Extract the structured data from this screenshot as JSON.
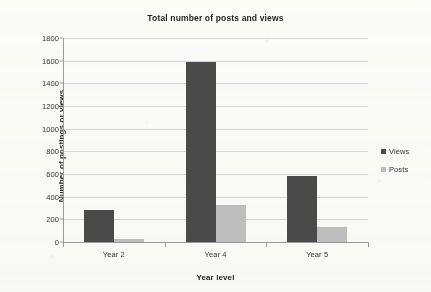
{
  "chart_data": {
    "type": "bar",
    "title": "Total number of posts and views",
    "xlabel": "Year level",
    "ylabel": "Number of postings or views",
    "categories": [
      "Year 2",
      "Year 4",
      "Year 5"
    ],
    "series": [
      {
        "name": "Views",
        "color": "#4a4a4a",
        "values": [
          280,
          1590,
          580
        ]
      },
      {
        "name": "Posts",
        "color": "#bdbdbd",
        "values": [
          30,
          330,
          135
        ]
      }
    ],
    "ylim": [
      0,
      1800
    ],
    "ytick_step": 200,
    "ytick_labels": [
      "1800",
      "1600",
      "1400",
      "1200",
      "1000",
      "800",
      "600",
      "400",
      "200",
      "0"
    ],
    "grid": "horizontal",
    "legend_position": "right"
  },
  "legend": {
    "entries": [
      {
        "label": "Views",
        "color": "#4a4a4a"
      },
      {
        "label": "Posts",
        "color": "#bdbdbd"
      }
    ]
  }
}
